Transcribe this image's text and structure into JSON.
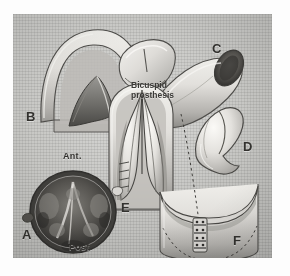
{
  "figure": {
    "medium": "halftone grayscale anatomical illustration",
    "panel_background": "#c8c8c5",
    "ink_color": "#33322f"
  },
  "annotations": {
    "caption_bicuspid_line1": "Bicuspid",
    "caption_bicuspid_line2": "prosthesis",
    "orientation_anterior": "Ant.",
    "orientation_posterior": "Post."
  },
  "panels": [
    {
      "id": "A",
      "label": "A",
      "x": 22,
      "y": 228,
      "depicts": "cross-section of vessel lumen with valve leaflets"
    },
    {
      "id": "B",
      "label": "B",
      "x": 26,
      "y": 110,
      "depicts": "longitudinal opened vessel with native valve cusp"
    },
    {
      "id": "C",
      "label": "C",
      "x": 212,
      "y": 42,
      "depicts": "tubular graft segment and excised cuff"
    },
    {
      "id": "D",
      "label": "D",
      "x": 243,
      "y": 140,
      "depicts": "bicuspid prosthesis leaflet, isolated"
    },
    {
      "id": "E",
      "label": "E",
      "x": 121,
      "y": 201,
      "depicts": "prosthesis seated inside vessel, open view"
    },
    {
      "id": "F",
      "label": "F",
      "x": 233,
      "y": 234,
      "depicts": "vessel cuff with suture row and dashed outline"
    }
  ]
}
